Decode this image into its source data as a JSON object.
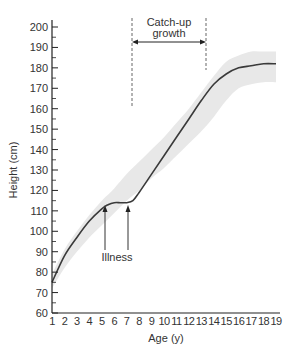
{
  "chart_data": {
    "type": "line",
    "title": "",
    "xlabel": "Age (y)",
    "ylabel": "Height (cm)",
    "xlim": [
      1,
      19
    ],
    "ylim": [
      60,
      200
    ],
    "x_ticks": [
      1,
      2,
      3,
      4,
      5,
      6,
      7,
      8,
      9,
      10,
      11,
      12,
      13,
      14,
      15,
      16,
      17,
      18,
      19
    ],
    "y_ticks": [
      60,
      70,
      80,
      90,
      100,
      110,
      120,
      130,
      140,
      150,
      160,
      170,
      180,
      190,
      200
    ],
    "grid": false,
    "series": [
      {
        "name": "Child height",
        "x": [
          1,
          2,
          3,
          4,
          5,
          5.5,
          6,
          6.5,
          7,
          7.5,
          8,
          9,
          10,
          11,
          12,
          13,
          14,
          15,
          16,
          17,
          18,
          19
        ],
        "values": [
          75,
          88,
          97,
          105,
          111,
          113,
          114,
          114,
          114,
          115,
          119,
          128,
          137,
          146,
          155,
          164,
          172,
          177,
          180,
          181,
          182,
          182
        ]
      }
    ],
    "normal_range_band": {
      "x": [
        1,
        2,
        3,
        4,
        5,
        6,
        7,
        8,
        9,
        10,
        11,
        12,
        13,
        14,
        15,
        16,
        17,
        18,
        19
      ],
      "upper": [
        79,
        91,
        100,
        108,
        115,
        121,
        128,
        134,
        140,
        146,
        153,
        160,
        168,
        176,
        183,
        186,
        188,
        188,
        188
      ],
      "lower": [
        72,
        82,
        90,
        97,
        103,
        109,
        115,
        120,
        126,
        131,
        137,
        143,
        149,
        156,
        164,
        170,
        172,
        173,
        173
      ]
    },
    "annotations": [
      {
        "text": "Illness",
        "arrows_at_x": [
          5.5,
          7.4
        ],
        "arrow_tip_y": 113
      },
      {
        "text_line1": "Catch-up",
        "text_line2": "growth",
        "span_x": [
          7.6,
          13.6
        ],
        "type": "double-arrow with dashed verticals"
      }
    ],
    "colors": {
      "line": "#3a3a3a",
      "band": "#e8e8e8",
      "axis": "#222222"
    }
  }
}
